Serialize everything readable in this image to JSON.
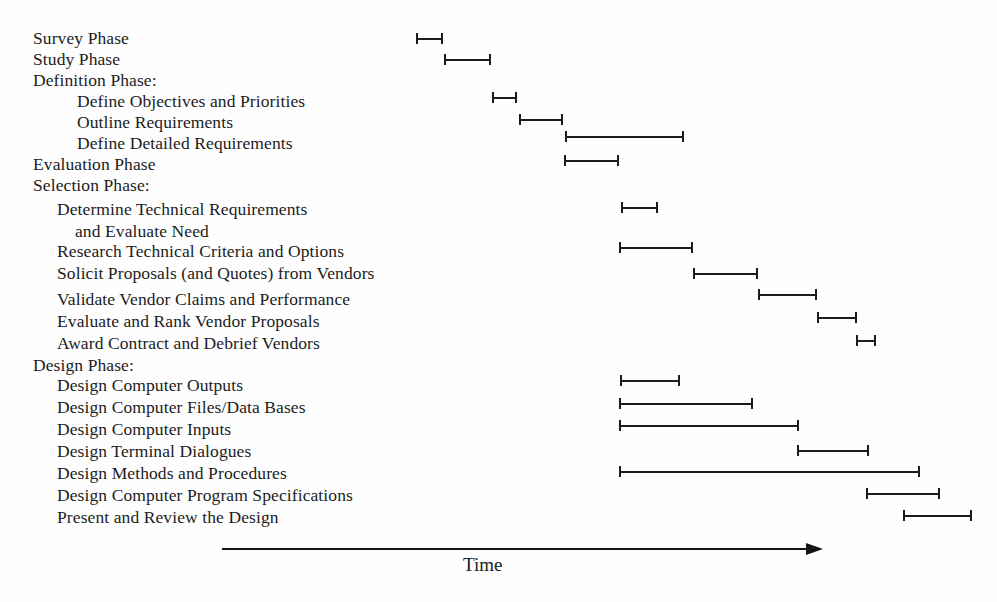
{
  "chart_data": {
    "type": "bar",
    "title": "",
    "subtitle": "",
    "xlabel": "Time",
    "ylabel": "",
    "orientation": "horizontal",
    "style": "gantt",
    "grid": false,
    "legend": null,
    "axis": {
      "label": "Time",
      "arrow": true,
      "direction": "right",
      "ticks": [],
      "tick_labels": [],
      "range_px": [
        222,
        822
      ],
      "note": "Unlabeled time axis drawn as a single right-pointing arrow."
    },
    "colors": {
      "background": "#fefefe",
      "text": "#1c1c1c",
      "bar": "#1c1c1c",
      "axis": "#141414"
    },
    "categories": [
      "Survey Phase",
      "Study Phase",
      "Definition Phase:",
      "Define Objectives and Priorities",
      "Outline Requirements",
      "Define Detailed Requirements",
      "Evaluation Phase",
      "Selection Phase:",
      "Determine Technical Requirements and Evaluate Need",
      "Research Technical Criteria and Options",
      "Solicit Proposals (and Quotes) from Vendors",
      "Validate Vendor Claims and Performance",
      "Evaluate and Rank Vendor Proposals",
      "Award Contract and Debrief Vendors",
      "Design Phase:",
      "Design Computer Outputs",
      "Design Computer Files/Data Bases",
      "Design Computer Inputs",
      "Design Terminal Dialogues",
      "Design Methods and Procedures",
      "Design Computer Program Specifications",
      "Present and Review the Design"
    ],
    "values": [
      [
        416,
        443
      ],
      [
        444,
        491
      ],
      null,
      [
        492,
        517
      ],
      [
        519,
        563
      ],
      [
        565,
        684
      ],
      [
        564,
        619
      ],
      null,
      [
        621,
        658
      ],
      [
        619,
        693
      ],
      [
        693,
        758
      ],
      [
        758,
        817
      ],
      [
        817,
        857
      ],
      [
        856,
        876
      ],
      null,
      [
        620,
        680
      ],
      [
        619,
        753
      ],
      [
        619,
        799
      ],
      [
        797,
        869
      ],
      [
        619,
        920
      ],
      [
        866,
        940
      ],
      [
        903,
        972
      ]
    ],
    "value_unit": "px along unlabeled time axis"
  },
  "rows": [
    {
      "label": "Survey Phase",
      "level": 0,
      "x": 33,
      "y": 28,
      "bar": {
        "start": 416,
        "end": 443,
        "y": 33
      }
    },
    {
      "label": "Study Phase",
      "level": 0,
      "x": 33,
      "y": 49,
      "bar": {
        "start": 444,
        "end": 491,
        "y": 54
      }
    },
    {
      "label": "Definition Phase:",
      "level": 0,
      "x": 33,
      "y": 70,
      "bar": null
    },
    {
      "label": "Define Objectives and Priorities",
      "level": 2,
      "x": 77,
      "y": 91,
      "bar": {
        "start": 492,
        "end": 517,
        "y": 92
      }
    },
    {
      "label": "Outline Requirements",
      "level": 2,
      "x": 77,
      "y": 112,
      "bar": {
        "start": 519,
        "end": 563,
        "y": 114
      }
    },
    {
      "label": "Define Detailed Requirements",
      "level": 2,
      "x": 77,
      "y": 133,
      "bar": {
        "start": 565,
        "end": 684,
        "y": 131
      }
    },
    {
      "label": "Evaluation Phase",
      "level": 0,
      "x": 33,
      "y": 154,
      "bar": {
        "start": 564,
        "end": 619,
        "y": 155
      }
    },
    {
      "label": "Selection Phase:",
      "level": 0,
      "x": 33,
      "y": 175,
      "bar": null
    },
    {
      "label": "Determine Technical Requirements",
      "level": 1,
      "x": 57,
      "y": 199,
      "bar": {
        "start": 621,
        "end": 658,
        "y": 202
      }
    },
    {
      "label": "and Evaluate Need",
      "level": 3,
      "x": 75,
      "y": 221,
      "bar": null
    },
    {
      "label": "Research Technical Criteria and Options",
      "level": 1,
      "x": 57,
      "y": 241,
      "bar": {
        "start": 619,
        "end": 693,
        "y": 242
      }
    },
    {
      "label": "Solicit Proposals (and Quotes) from Vendors",
      "level": 1,
      "x": 57,
      "y": 263,
      "bar": {
        "start": 693,
        "end": 758,
        "y": 268
      }
    },
    {
      "label": "Validate Vendor Claims and Performance",
      "level": 1,
      "x": 57,
      "y": 289,
      "bar": {
        "start": 758,
        "end": 817,
        "y": 289
      }
    },
    {
      "label": "Evaluate and Rank Vendor Proposals",
      "level": 1,
      "x": 57,
      "y": 311,
      "bar": {
        "start": 817,
        "end": 857,
        "y": 312
      }
    },
    {
      "label": "Award Contract and Debrief Vendors",
      "level": 1,
      "x": 57,
      "y": 333,
      "bar": {
        "start": 856,
        "end": 876,
        "y": 335
      }
    },
    {
      "label": "Design Phase:",
      "level": 0,
      "x": 33,
      "y": 355,
      "bar": null
    },
    {
      "label": "Design Computer Outputs",
      "level": 1,
      "x": 57,
      "y": 375,
      "bar": {
        "start": 620,
        "end": 680,
        "y": 375
      }
    },
    {
      "label": "Design Computer Files/Data Bases",
      "level": 1,
      "x": 57,
      "y": 397,
      "bar": {
        "start": 619,
        "end": 753,
        "y": 398
      }
    },
    {
      "label": "Design Computer Inputs",
      "level": 1,
      "x": 57,
      "y": 419,
      "bar": {
        "start": 619,
        "end": 799,
        "y": 420
      }
    },
    {
      "label": "Design Terminal Dialogues",
      "level": 1,
      "x": 57,
      "y": 441,
      "bar": {
        "start": 797,
        "end": 869,
        "y": 445
      }
    },
    {
      "label": "Design Methods and Procedures",
      "level": 1,
      "x": 57,
      "y": 463,
      "bar": {
        "start": 619,
        "end": 920,
        "y": 466
      }
    },
    {
      "label": "Design Computer Program Specifications",
      "level": 1,
      "x": 57,
      "y": 485,
      "bar": {
        "start": 866,
        "end": 940,
        "y": 488
      }
    },
    {
      "label": "Present and Review the Design",
      "level": 1,
      "x": 57,
      "y": 507,
      "bar": {
        "start": 903,
        "end": 972,
        "y": 510
      }
    }
  ],
  "axis": {
    "label": "Time",
    "line_start_x": 222,
    "line_end_x": 806,
    "arrow_tip_x": 823,
    "y": 548,
    "label_x": 463,
    "label_y": 554
  }
}
